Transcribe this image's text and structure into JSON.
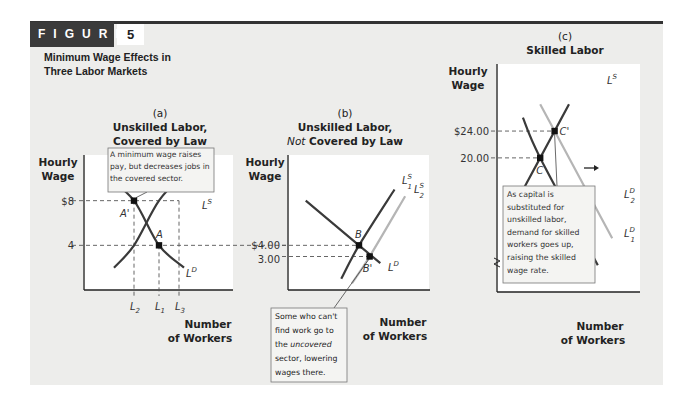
{
  "figure": {
    "label": "FIGURE",
    "number": "5",
    "title_line1": "Minimum Wage Effects in",
    "title_line2": "Three Labor Markets"
  },
  "colors": {
    "background": "#ededeb",
    "plot_area": "#ffffff",
    "dark_curve": "#3a3a3a",
    "light_curve": "#b5b5b5",
    "header": "#3b3b3b"
  },
  "chart_data": [
    {
      "type": "line",
      "panel": "(a)",
      "title_line1": "Unskilled Labor,",
      "title_line2": "Covered by Law",
      "ylabel_line1": "Hourly",
      "ylabel_line2": "Wage",
      "xlabel_line1": "Number",
      "xlabel_line2": "of Workers",
      "ytick_labels": [
        "$8",
        "4"
      ],
      "ytick_values": [
        8,
        4
      ],
      "xtick_labels": [
        "L2",
        "L1",
        "L3"
      ],
      "series": [
        {
          "name": "LS",
          "label": "L",
          "sup": "S",
          "role": "supply",
          "x": [
            1.2,
            2.0,
            3.0,
            4.0
          ],
          "y": [
            2.0,
            4.0,
            8.0,
            10.4
          ]
        },
        {
          "name": "LD",
          "label": "L",
          "sup": "D",
          "role": "demand",
          "x": [
            1.0,
            2.0,
            3.0,
            4.0
          ],
          "y": [
            10.0,
            8.0,
            4.0,
            2.0
          ]
        }
      ],
      "points": [
        {
          "label": "A'",
          "x": 2.0,
          "y": 8
        },
        {
          "label": "A",
          "x": 3.0,
          "y": 4
        }
      ],
      "annotation": "A minimum wage raises pay, but decreases jobs in the covered sector.",
      "xlim": [
        0,
        6
      ],
      "ylim": [
        0,
        12
      ]
    },
    {
      "type": "line",
      "panel": "(b)",
      "title_line1": "Unskilled Labor,",
      "title_line2_italic": "Not",
      "title_line2_rest": " Covered by Law",
      "ylabel_line1": "Hourly",
      "ylabel_line2": "Wage",
      "xlabel_line1": "Number",
      "xlabel_line2": "of Workers",
      "ytick_labels": [
        "$4.00",
        "3.00"
      ],
      "ytick_values": [
        4.0,
        3.0
      ],
      "series": [
        {
          "name": "L1S",
          "label": "L",
          "sub": "1",
          "sup": "S",
          "role": "supply",
          "x": [
            3.0,
            4.0,
            6.0
          ],
          "y": [
            1.0,
            4.0,
            9.0
          ]
        },
        {
          "name": "L2S",
          "label": "L",
          "sub": "2",
          "sup": "S",
          "role": "supply-shifted",
          "x": [
            3.6,
            4.6,
            6.6
          ],
          "y": [
            0.6,
            3.0,
            8.4
          ]
        },
        {
          "name": "LD",
          "label": "L",
          "sup": "D",
          "role": "demand",
          "x": [
            1.0,
            4.0,
            5.2
          ],
          "y": [
            8.0,
            4.0,
            2.4
          ]
        }
      ],
      "points": [
        {
          "label": "B",
          "x": 4.0,
          "y": 4.0
        },
        {
          "label": "B'",
          "x": 4.6,
          "y": 3.0
        }
      ],
      "annotation_line1": "Some who can't",
      "annotation_line2": "find work go to",
      "annotation_line3_pre": "the ",
      "annotation_line3_italic": "uncovered",
      "annotation_line4": "sector, lowering",
      "annotation_line5": "wages there.",
      "xlim": [
        0,
        8
      ],
      "ylim": [
        0,
        12
      ]
    },
    {
      "type": "line",
      "panel": "(c)",
      "title_line1": "Skilled Labor",
      "ylabel_line1": "Hourly",
      "ylabel_line2": "Wage",
      "xlabel_line1": "Number",
      "xlabel_line2": "of Workers",
      "ytick_labels": [
        "$24.00",
        "20.00"
      ],
      "ytick_values": [
        24.0,
        20.0
      ],
      "series": [
        {
          "name": "LS",
          "label": "L",
          "sup": "S",
          "role": "supply",
          "x": [
            1.0,
            3.0,
            4.0,
            5.0
          ],
          "y": [
            12.0,
            20.0,
            24.0,
            28.0
          ]
        },
        {
          "name": "L1D",
          "label": "L",
          "sub": "1",
          "sup": "D",
          "role": "demand",
          "x": [
            1.8,
            3.0,
            7.0
          ],
          "y": [
            26.0,
            20.0,
            4.0
          ]
        },
        {
          "name": "L2D",
          "label": "L",
          "sub": "2",
          "sup": "D",
          "role": "demand-shifted",
          "x": [
            3.0,
            4.0,
            8.0
          ],
          "y": [
            28.0,
            24.0,
            8.0
          ]
        }
      ],
      "points": [
        {
          "label": "C",
          "x": 3.0,
          "y": 20.0
        },
        {
          "label": "C'",
          "x": 4.0,
          "y": 24.0
        }
      ],
      "shift_arrow": "right",
      "annotation": [
        "As capital is",
        "substituted for",
        "unskilled labor,",
        "demand for skilled",
        "workers goes up,",
        "raising the skilled",
        "wage rate."
      ],
      "axis_break": true,
      "xlim": [
        0,
        10
      ],
      "ylim": [
        0,
        34
      ]
    }
  ]
}
